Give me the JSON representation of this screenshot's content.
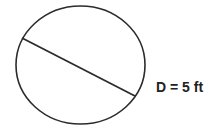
{
  "diagram": {
    "shape": "circle",
    "label": "D = 5 ft",
    "circle": {
      "cx": 80.5,
      "cy": 65,
      "rx": 64.5,
      "ry": 59
    },
    "diameter_line": {
      "x1": 22,
      "y1": 38,
      "x2": 135,
      "y2": 96
    },
    "stroke_color": "#2b2b2b",
    "text_color": "#222222"
  }
}
